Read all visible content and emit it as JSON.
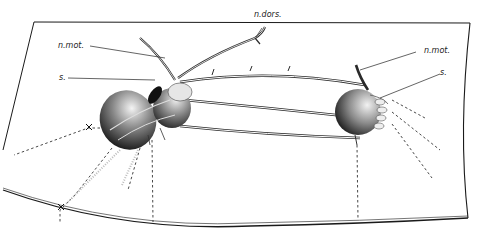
{
  "figure": {
    "type": "anatomical illustration",
    "labels": {
      "dorsal_nerve": "n.dors.",
      "motor_nerve_left": "n.mot.",
      "motor_nerve_right": "n.mot.",
      "spiracle_left": "s.",
      "spiracle_right": "s."
    },
    "colors": {
      "ink": "#1a1a1a",
      "paper": "#ffffff",
      "shade": "#2a2a2a"
    }
  }
}
